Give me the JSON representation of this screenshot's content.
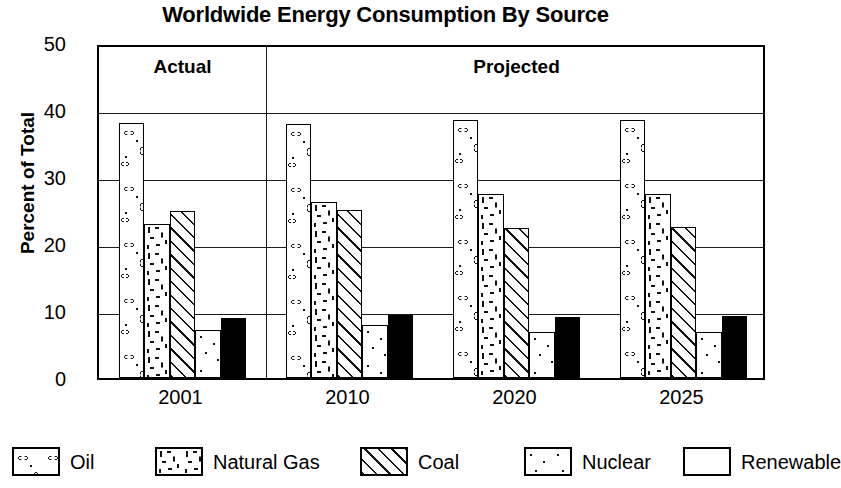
{
  "chart_data": {
    "type": "bar",
    "title": "Worldwide Energy Consumption By Source",
    "xlabel": "",
    "ylabel": "Percent of Total",
    "ylim": [
      0,
      50
    ],
    "ytick_step": 10,
    "yticks": [
      "50",
      "40",
      "30",
      "20",
      "10",
      "0"
    ],
    "grid": true,
    "legend_position": "bottom",
    "categories": [
      "2001",
      "2010",
      "2020",
      "2025"
    ],
    "series": [
      {
        "name": "Oil",
        "pattern": "blobs",
        "values": [
          38.0,
          37.9,
          38.5,
          38.5
        ]
      },
      {
        "name": "Natural Gas",
        "pattern": "squiggles",
        "values": [
          23.0,
          26.2,
          27.5,
          27.5
        ]
      },
      {
        "name": "Coal",
        "pattern": "hatch",
        "values": [
          25.0,
          25.1,
          22.4,
          22.5
        ]
      },
      {
        "name": "Nuclear",
        "pattern": "dots",
        "values": [
          7.2,
          7.9,
          6.8,
          6.9
        ]
      },
      {
        "name": "Renewable",
        "pattern": "solid",
        "values": [
          9.0,
          9.4,
          9.1,
          9.2
        ]
      }
    ],
    "annotations": [
      {
        "label": "Actual",
        "span_start": 0,
        "span_end": 1
      },
      {
        "label": "Projected",
        "span_start": 1,
        "span_end": 4
      }
    ]
  },
  "legend": {
    "items": [
      {
        "label": "Oil",
        "swatch": "oil-pattern-swatch"
      },
      {
        "label": "Natural Gas",
        "swatch": "natural-gas-pattern-swatch"
      },
      {
        "label": "Coal",
        "swatch": "coal-pattern-swatch"
      },
      {
        "label": "Nuclear",
        "swatch": "nuclear-pattern-swatch"
      },
      {
        "label": "Renewable",
        "swatch": "renewable-pattern-swatch"
      }
    ]
  },
  "colors": {
    "ink": "#000000",
    "background": "#ffffff",
    "gridline": "#1a1a1a"
  }
}
